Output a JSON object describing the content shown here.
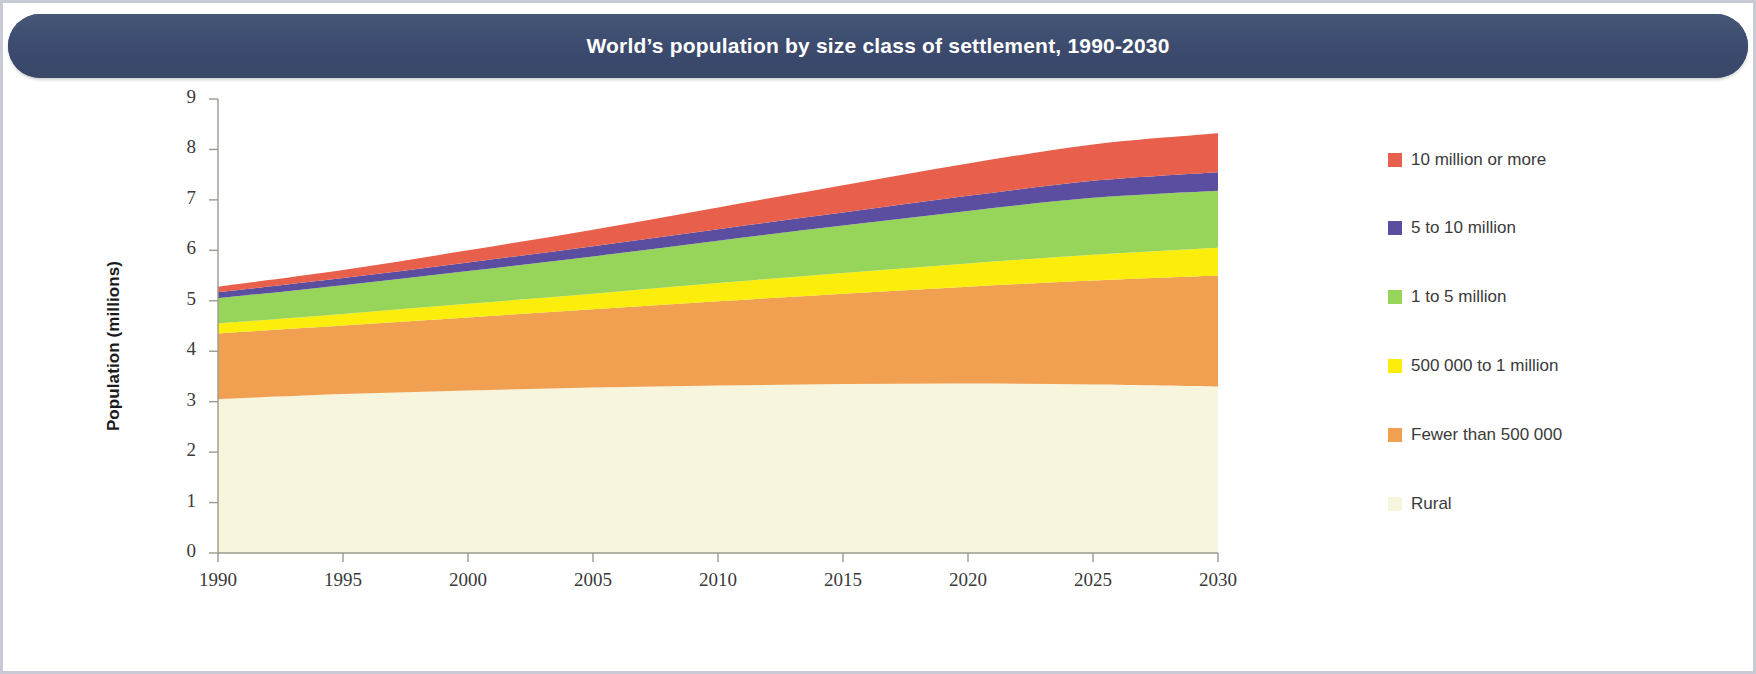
{
  "title": "World’s population by size class of settlement, 1990-2030",
  "theme": {
    "title_bar_color": "#3d4d72",
    "title_text_color": "#ffffff",
    "axis_color": "#9a9a8f",
    "tick_text_color": "#3a3a3a",
    "plot_background": "#ffffff"
  },
  "axes": {
    "y_title": "Population (millions)",
    "y_ticks": [
      "0",
      "1",
      "2",
      "3",
      "4",
      "5",
      "6",
      "7",
      "8",
      "9"
    ],
    "x_ticks": [
      "1990",
      "1995",
      "2000",
      "2005",
      "2010",
      "2015",
      "2020",
      "2025",
      "2030"
    ]
  },
  "legend": {
    "items": [
      {
        "label": "10 million or more",
        "color": "#e8604c"
      },
      {
        "label": "5 to 10 million",
        "color": "#5b4ea0"
      },
      {
        "label": "1 to 5 million",
        "color": "#96d45a"
      },
      {
        "label": "500 000 to 1 million",
        "color": "#fced0b"
      },
      {
        "label": "Fewer than 500 000",
        "color": "#f0a050"
      },
      {
        "label": "Rural",
        "color": "#f7f5dc"
      }
    ]
  },
  "chart_data": {
    "type": "area",
    "stacked": true,
    "title": "World’s population by size class of settlement, 1990-2030",
    "xlabel": "",
    "ylabel": "Population (millions)",
    "xlim": [
      1990,
      2030
    ],
    "ylim": [
      0,
      9
    ],
    "grid": false,
    "legend_position": "right",
    "x": [
      1990,
      1995,
      2000,
      2005,
      2010,
      2015,
      2020,
      2025,
      2030
    ],
    "series": [
      {
        "name": "Rural",
        "color": "#f7f5dc",
        "values": [
          3.05,
          3.15,
          3.22,
          3.28,
          3.32,
          3.35,
          3.36,
          3.34,
          3.3
        ]
      },
      {
        "name": "Fewer than 500 000",
        "color": "#f0a050",
        "values": [
          1.3,
          1.36,
          1.45,
          1.55,
          1.67,
          1.79,
          1.92,
          2.06,
          2.2
        ]
      },
      {
        "name": "500 000 to 1 million",
        "color": "#fced0b",
        "values": [
          0.2,
          0.23,
          0.27,
          0.31,
          0.36,
          0.41,
          0.46,
          0.51,
          0.55
        ]
      },
      {
        "name": "1 to 5 million",
        "color": "#96d45a",
        "values": [
          0.5,
          0.57,
          0.65,
          0.74,
          0.84,
          0.94,
          1.04,
          1.13,
          1.13
        ]
      },
      {
        "name": "5 to 10 million",
        "color": "#5b4ea0",
        "values": [
          0.12,
          0.14,
          0.17,
          0.2,
          0.23,
          0.26,
          0.3,
          0.34,
          0.37
        ]
      },
      {
        "name": "10 million or more",
        "color": "#e8604c",
        "values": [
          0.11,
          0.16,
          0.24,
          0.33,
          0.43,
          0.54,
          0.64,
          0.72,
          0.77
        ]
      }
    ],
    "cumulative_top_values": {
      "Rural": [
        3.05,
        3.15,
        3.22,
        3.28,
        3.32,
        3.35,
        3.36,
        3.34,
        3.3
      ],
      "Fewer than 500 000": [
        4.35,
        4.51,
        4.67,
        4.83,
        4.99,
        5.14,
        5.28,
        5.4,
        5.5
      ],
      "500 000 to 1 million": [
        4.55,
        4.74,
        4.94,
        5.14,
        5.35,
        5.55,
        5.74,
        5.91,
        6.05
      ],
      "1 to 5 million": [
        5.05,
        5.31,
        5.59,
        5.88,
        6.19,
        6.49,
        6.78,
        7.04,
        7.18
      ],
      "5 to 10 million": [
        5.17,
        5.45,
        5.76,
        6.08,
        6.42,
        6.75,
        7.08,
        7.38,
        7.55
      ],
      "10 million or more": [
        5.28,
        5.61,
        6.0,
        6.41,
        6.85,
        7.29,
        7.72,
        8.1,
        8.32
      ]
    }
  }
}
